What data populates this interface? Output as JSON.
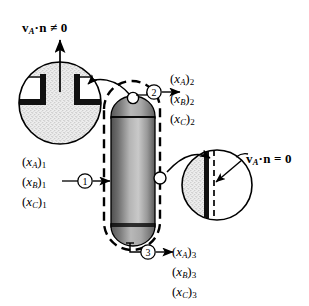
{
  "figure": {
    "background_color": "#ffffff",
    "line_color": "#000000"
  },
  "annotations": {
    "top_flux": {
      "symbol_v": "v",
      "sub_A": "A",
      "dot": "·",
      "symbol_n": "n",
      "relation": "≠",
      "value": "0",
      "full_text": "v_A·n ≠ 0",
      "meaning": "species-A velocity normal component nonzero at open port"
    },
    "right_flux": {
      "symbol_v": "v",
      "sub_A": "A",
      "dot": "·",
      "symbol_n": "n",
      "relation": "=",
      "value": "0",
      "full_text": "v_A·n = 0",
      "meaning": "no flux through the solid impermeable wall"
    }
  },
  "streams": [
    {
      "id": "stream-1",
      "marker": "1",
      "direction": "inlet",
      "position": "left",
      "species": [
        {
          "symbol": "x",
          "species_sub": "A",
          "stream_idx": "1"
        },
        {
          "symbol": "x",
          "species_sub": "B",
          "stream_idx": "1"
        },
        {
          "symbol": "x",
          "species_sub": "C",
          "stream_idx": "1"
        }
      ]
    },
    {
      "id": "stream-2",
      "marker": "2",
      "direction": "outlet",
      "position": "top",
      "species": [
        {
          "symbol": "x",
          "species_sub": "A",
          "stream_idx": "2"
        },
        {
          "symbol": "x",
          "species_sub": "B",
          "stream_idx": "2"
        },
        {
          "symbol": "x",
          "species_sub": "C",
          "stream_idx": "2"
        }
      ]
    },
    {
      "id": "stream-3",
      "marker": "3",
      "direction": "outlet",
      "position": "bottom",
      "species": [
        {
          "symbol": "x",
          "species_sub": "A",
          "stream_idx": "3"
        },
        {
          "symbol": "x",
          "species_sub": "B",
          "stream_idx": "3"
        },
        {
          "symbol": "x",
          "species_sub": "C",
          "stream_idx": "3"
        }
      ]
    }
  ],
  "vessel": {
    "shape": "vertical-capsule",
    "fill_dark": "#4a4a4a",
    "fill_light": "#d8d8d8",
    "outline_color": "#000000",
    "control_surface_style": "dashed",
    "control_surface_color": "#000000"
  },
  "detail_views": [
    {
      "id": "detail-open-port",
      "position": "top-left",
      "depicts": "open nozzle where species cross the control surface",
      "fluid_fill": "#e9e9e9"
    },
    {
      "id": "detail-solid-wall",
      "position": "right",
      "depicts": "impermeable wall coincident with the control surface",
      "fluid_fill": "#e9e9e9"
    }
  ]
}
